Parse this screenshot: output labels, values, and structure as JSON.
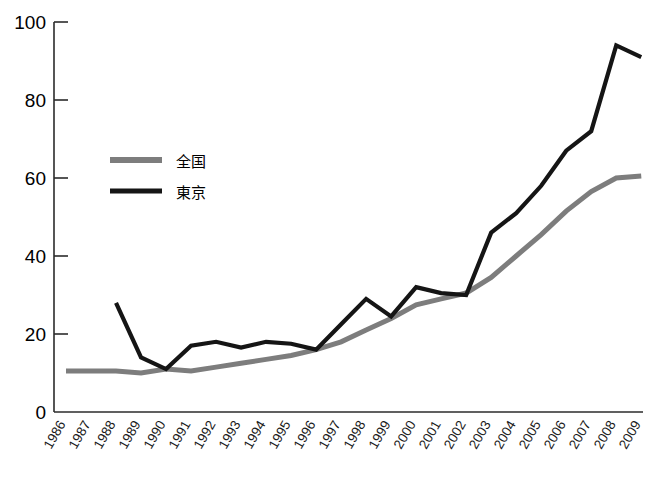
{
  "chart_data": {
    "type": "line",
    "title": "",
    "xlabel": "",
    "ylabel": "",
    "ylim": [
      0,
      100
    ],
    "yticks": [
      0,
      20,
      40,
      60,
      80,
      100
    ],
    "grid": false,
    "legend_position": "inside-upper-left",
    "categories": [
      "1986",
      "1987",
      "1988",
      "1989",
      "1990",
      "1991",
      "1992",
      "1993",
      "1994",
      "1995",
      "1996",
      "1997",
      "1998",
      "1999",
      "2000",
      "2001",
      "2002",
      "2003",
      "2004",
      "2005",
      "2006",
      "2007",
      "2008",
      "2009"
    ],
    "series": [
      {
        "name": "全国",
        "color": "#7d7d7d",
        "values": [
          10.5,
          10.5,
          10.5,
          10.0,
          11.0,
          10.5,
          11.5,
          12.5,
          13.5,
          14.5,
          16.0,
          18.0,
          21.0,
          24.0,
          27.5,
          29.0,
          30.5,
          34.5,
          40.0,
          45.5,
          51.5,
          56.5,
          60.0,
          60.5
        ]
      },
      {
        "name": "東京",
        "color": "#151515",
        "values": [
          null,
          null,
          28.0,
          14.0,
          11.0,
          17.0,
          18.0,
          16.5,
          18.0,
          17.5,
          16.0,
          22.5,
          29.0,
          24.5,
          32.0,
          30.5,
          30.0,
          46.0,
          51.0,
          58.0,
          67.0,
          72.0,
          94.0,
          91.0
        ]
      }
    ]
  },
  "legend": {
    "entries": [
      {
        "label": "全国",
        "swatch_color": "#7d7d7d"
      },
      {
        "label": "東京",
        "swatch_color": "#151515"
      }
    ]
  },
  "axes": {
    "y_tick_labels": [
      "100",
      "80",
      "60",
      "40",
      "20",
      "0"
    ],
    "x_tick_labels": [
      "1986",
      "1987",
      "1988",
      "1989",
      "1990",
      "1991",
      "1992",
      "1993",
      "1994",
      "1995",
      "1996",
      "1997",
      "1998",
      "1999",
      "2000",
      "2001",
      "2002",
      "2003",
      "2004",
      "2005",
      "2006",
      "2007",
      "2008",
      "2009"
    ]
  },
  "colors": {
    "national_line": "#7d7d7d",
    "tokyo_line": "#151515",
    "axis": "#2b2b2b",
    "background": "#ffffff"
  }
}
